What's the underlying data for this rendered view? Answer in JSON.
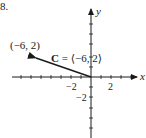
{
  "problem": {
    "number_label": "8."
  },
  "axes": {
    "x_label": "x",
    "y_label": "y",
    "x_ticks": [
      -7,
      -6,
      -5,
      -4,
      -3,
      -2,
      -1,
      1,
      2,
      3,
      4
    ],
    "y_ticks": [
      -6,
      -5,
      -4,
      -3,
      -2,
      -1,
      1,
      2,
      3,
      4,
      5,
      6
    ],
    "x_tick_labels": [
      {
        "value": -2,
        "text": "−2"
      },
      {
        "value": 2,
        "text": "2"
      }
    ],
    "y_tick_labels": [
      {
        "value": -2,
        "text": "−2"
      }
    ],
    "color": "#1a1a1a"
  },
  "vector": {
    "name": "C",
    "equals": " = ",
    "components_text": "⟨−6, 2⟩",
    "from": [
      0,
      0
    ],
    "to": [
      -6,
      2
    ],
    "color": "#1a1a1a"
  },
  "point": {
    "label": "(−6, 2)",
    "x": -6,
    "y": 2
  }
}
